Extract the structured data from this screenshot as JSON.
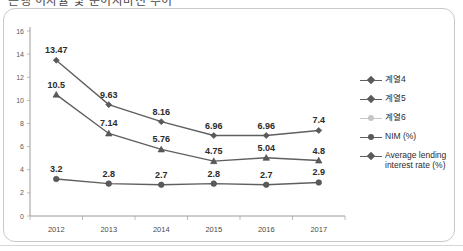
{
  "title": {
    "text": "은행 이자율 및 순이자마진 추이",
    "visible_fragment": true
  },
  "chart_data": {
    "type": "line",
    "title": "은행 이자율 및 순이자마진 추이",
    "xlabel": "",
    "ylabel": "",
    "x": [
      "2012",
      "2013",
      "2014",
      "2015",
      "2016",
      "2017"
    ],
    "categories": [
      "2012",
      "2013",
      "2014",
      "2015",
      "2016",
      "2017"
    ],
    "ylim": [
      0,
      16
    ],
    "ytick_step": 2,
    "yticks": [
      "0",
      "2",
      "4",
      "6",
      "8",
      "10",
      "12",
      "14",
      "16"
    ],
    "grid": false,
    "legend_position": "right",
    "series": [
      {
        "name": "계열4",
        "marker": "diamond",
        "color": "#5a5a5a",
        "values": [
          13.47,
          9.63,
          8.16,
          6.96,
          6.96,
          7.4
        ],
        "labels": [
          "13.47",
          "9.63",
          "8.16",
          "6.96",
          "6.96",
          "7.4"
        ]
      },
      {
        "name": "계열5",
        "marker": "triangle",
        "color": "#5a5a5a",
        "values": [
          10.5,
          7.14,
          5.76,
          4.75,
          5.04,
          4.8
        ],
        "labels": [
          "10.5",
          "7.14",
          "5.76",
          "4.75",
          "5.04",
          "4.8"
        ]
      },
      {
        "name": "NIM (%)",
        "marker": "circle",
        "color": "#4a4a4a",
        "values": [
          3.2,
          2.8,
          2.7,
          2.8,
          2.7,
          2.9
        ],
        "labels": [
          "3.2",
          "2.8",
          "2.7",
          "2.8",
          "2.7",
          "2.9"
        ]
      }
    ]
  },
  "legend": {
    "items": [
      {
        "label": "계열4",
        "marker": "diamond",
        "faint": false
      },
      {
        "label": "계열5",
        "marker": "diamond",
        "faint": false
      },
      {
        "label": "계열6",
        "marker": "circle",
        "faint": true
      },
      {
        "label": "NIM (%)",
        "marker": "circle",
        "faint": false
      },
      {
        "label": "Average lending interest rate (%)",
        "marker": "diamond",
        "faint": false
      }
    ]
  },
  "axis": {
    "y_labels": [
      "16",
      "14",
      "12",
      "10",
      "8",
      "6",
      "4",
      "2",
      "0"
    ],
    "x_labels": [
      "2012",
      "2013",
      "2014",
      "2015",
      "2016",
      "2017"
    ]
  }
}
